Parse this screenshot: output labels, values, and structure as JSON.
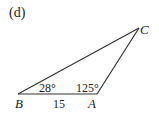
{
  "figure": {
    "label": "(d)",
    "triangle": {
      "vertices": {
        "A": {
          "name": "A",
          "x": 97,
          "y": 94
        },
        "B": {
          "name": "B",
          "x": 18,
          "y": 94
        },
        "C": {
          "name": "C",
          "x": 139,
          "y": 28
        }
      },
      "angles": {
        "B": "28°",
        "A": "125°"
      },
      "sides": {
        "AB": "15"
      }
    },
    "colors": {
      "line": "#333333",
      "text": "#222222",
      "background": "#ffffff"
    }
  }
}
